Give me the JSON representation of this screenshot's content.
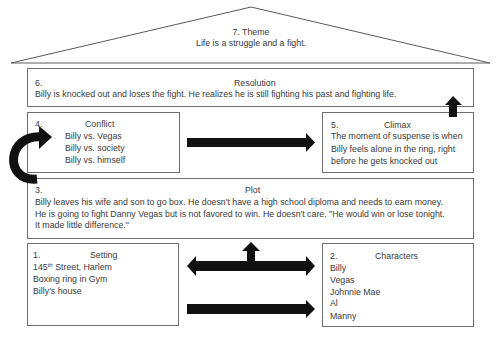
{
  "theme": {
    "heading": "7. Theme",
    "text": "Life is a struggle and a fight."
  },
  "resolution": {
    "number": "6.",
    "title": "Resolution",
    "lines": [
      "Billy is knocked out and loses the fight. He realizes he is still fighting his past and fighting life."
    ]
  },
  "conflict": {
    "number": "4.",
    "title": "Conflict",
    "lines": [
      "Billy vs. Vegas",
      "Billy vs. society",
      "Billy vs. himself"
    ]
  },
  "climax": {
    "number": "5.",
    "title": "Climax",
    "lines": [
      "The moment of suspense is when",
      "Billy feels alone in the ring, right",
      "before he gets knocked out"
    ]
  },
  "plot": {
    "number": "3.",
    "title": "Plot",
    "lines": [
      "Billy leaves his wife and son to go box. He doesn't have a high school diploma and needs to earn money.",
      "He is going to fight Danny Vegas but is not favored to win. He doesn't care. \"He would win or lose tonight.",
      "It made little difference.\""
    ]
  },
  "setting": {
    "number": "1.",
    "title": "Setting",
    "line1_number": "145",
    "line1_sup": "th",
    "line1_rest": " Street, Harlem",
    "lines": [
      "Boxing ring in Gym",
      "Billy's house"
    ]
  },
  "characters": {
    "number": "2.",
    "title": "Characters",
    "lines": [
      "Billy",
      "Vegas",
      "Johnnie Mae",
      "Al",
      "Manny"
    ]
  },
  "arrows": {
    "color": "#111111",
    "curved": "curved-arrow-plot-to-conflict",
    "conflict_to_climax": "right-arrow",
    "climax_to_resolution": "up-arrow",
    "setting_characters": "double-arrow-with-up",
    "bottom": "right-arrow"
  }
}
